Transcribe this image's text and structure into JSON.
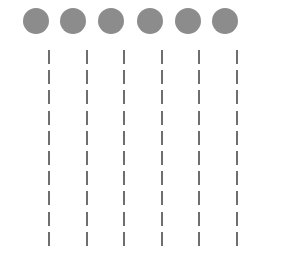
{
  "diagram": {
    "circle_color": "#8c8c8c",
    "dash_color": "#6e6e6e",
    "circles": [
      {
        "cx": 36,
        "cy": 21
      },
      {
        "cx": 73,
        "cy": 21
      },
      {
        "cx": 111,
        "cy": 21
      },
      {
        "cx": 150,
        "cy": 21
      },
      {
        "cx": 188,
        "cy": 21
      },
      {
        "cx": 225,
        "cy": 21
      }
    ],
    "circle_diameter": 26,
    "dashed_lines": [
      {
        "x": 49
      },
      {
        "x": 87
      },
      {
        "x": 124
      },
      {
        "x": 162
      },
      {
        "x": 199
      },
      {
        "x": 237
      }
    ],
    "dash_count_per_line": 10,
    "dash_start_y": 50,
    "dash_period": 20.2,
    "dash_length": 14
  }
}
